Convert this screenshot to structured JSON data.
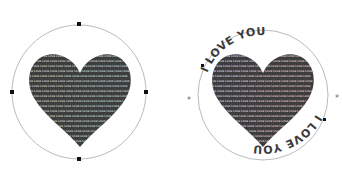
{
  "figures": [
    {
      "id": "left",
      "description": "Heart shape filled with repeated text inside a circle with four handles",
      "heart_fill_word": "Love",
      "fill_text_line": "Love Love Love Love Love Love Love Love Love Love Love Love Love",
      "handles": 4
    },
    {
      "id": "right",
      "description": "Heart shape filled with text, with text wrapped on a circular path",
      "fill_text_line": "Love Love Love Love Love Love Love Love Love Love Love Love Love",
      "ring_text_top": "I    LOVE    YOU",
      "ring_text_bottom": "I    LOVE    YOU"
    }
  ],
  "colors": {
    "heart": "#3d3d3d",
    "circle": "#9a9a9a",
    "handle": "#111111",
    "ring_text": "#3a3a3a"
  }
}
